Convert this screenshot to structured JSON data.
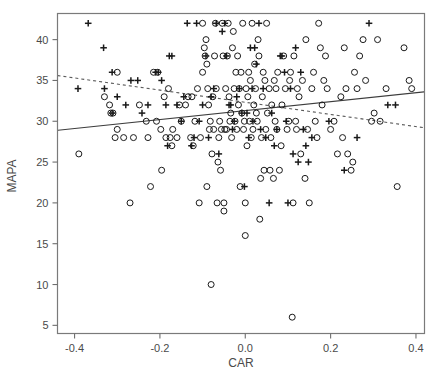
{
  "figure": {
    "background_color": "#ffffff",
    "frame_color": "#7a7a7a",
    "axis_color": "#6e6e6e",
    "label_color": "#4a4a4a",
    "marker_color": "#1a1a1a"
  },
  "chart_data": {
    "type": "scatter",
    "title": "",
    "xlabel": "CAR",
    "ylabel": "MAPA",
    "xlim": [
      -0.44,
      0.42
    ],
    "ylim": [
      4.0,
      43.2
    ],
    "xticks": [
      -0.4,
      -0.2,
      0.0,
      0.2,
      0.4
    ],
    "xticklabels": [
      "-0.4",
      "-0.2",
      "0.0",
      "0.2",
      "0.4"
    ],
    "yticks": [
      5,
      10,
      15,
      20,
      25,
      30,
      35,
      40
    ],
    "yticklabels": [
      "5",
      "10",
      "15",
      "20",
      "25",
      "30",
      "35",
      "40"
    ],
    "grid": false,
    "legend": null,
    "frame": "box",
    "series": [
      {
        "name": "circle-group",
        "marker": "circle",
        "points": [
          [
            -0.39,
            26
          ],
          [
            -0.33,
            33
          ],
          [
            -0.318,
            32
          ],
          [
            -0.315,
            31
          ],
          [
            -0.31,
            31
          ],
          [
            -0.3,
            29
          ],
          [
            -0.3,
            36
          ],
          [
            -0.305,
            28
          ],
          [
            -0.285,
            28
          ],
          [
            -0.27,
            20
          ],
          [
            -0.262,
            28
          ],
          [
            -0.248,
            32
          ],
          [
            -0.232,
            30
          ],
          [
            -0.228,
            28
          ],
          [
            -0.222,
            22
          ],
          [
            -0.215,
            36
          ],
          [
            -0.208,
            30
          ],
          [
            -0.205,
            36
          ],
          [
            -0.198,
            29
          ],
          [
            -0.196,
            24
          ],
          [
            -0.19,
            33
          ],
          [
            -0.186,
            28
          ],
          [
            -0.18,
            34
          ],
          [
            -0.176,
            28
          ],
          [
            -0.172,
            27
          ],
          [
            -0.17,
            29
          ],
          [
            -0.16,
            28
          ],
          [
            -0.154,
            32
          ],
          [
            -0.15,
            30
          ],
          [
            -0.14,
            32
          ],
          [
            -0.134,
            33
          ],
          [
            -0.128,
            28
          ],
          [
            -0.125,
            33
          ],
          [
            -0.122,
            27
          ],
          [
            -0.118,
            30
          ],
          [
            -0.112,
            34
          ],
          [
            -0.108,
            20
          ],
          [
            -0.105,
            28
          ],
          [
            -0.1,
            36
          ],
          [
            -0.1,
            42
          ],
          [
            -0.096,
            39
          ],
          [
            -0.094,
            38
          ],
          [
            -0.092,
            40
          ],
          [
            -0.09,
            37
          ],
          [
            -0.09,
            22
          ],
          [
            -0.088,
            34
          ],
          [
            -0.086,
            32
          ],
          [
            -0.084,
            29
          ],
          [
            -0.082,
            30
          ],
          [
            -0.08,
            10
          ],
          [
            -0.078,
            26
          ],
          [
            -0.076,
            33
          ],
          [
            -0.074,
            29
          ],
          [
            -0.072,
            38
          ],
          [
            -0.07,
            42
          ],
          [
            -0.068,
            34
          ],
          [
            -0.066,
            20
          ],
          [
            -0.064,
            25
          ],
          [
            -0.062,
            28
          ],
          [
            -0.06,
            30
          ],
          [
            -0.058,
            24
          ],
          [
            -0.056,
            29
          ],
          [
            -0.054,
            42
          ],
          [
            -0.052,
            38
          ],
          [
            -0.05,
            19
          ],
          [
            -0.05,
            20
          ],
          [
            -0.048,
            29
          ],
          [
            -0.046,
            34
          ],
          [
            -0.044,
            29
          ],
          [
            -0.042,
            38
          ],
          [
            -0.04,
            42
          ],
          [
            -0.038,
            33
          ],
          [
            -0.036,
            30
          ],
          [
            -0.034,
            31
          ],
          [
            -0.032,
            28
          ],
          [
            -0.03,
            39
          ],
          [
            -0.028,
            41
          ],
          [
            -0.026,
            34
          ],
          [
            -0.024,
            30
          ],
          [
            -0.022,
            36
          ],
          [
            -0.02,
            29
          ],
          [
            -0.018,
            38
          ],
          [
            -0.016,
            32
          ],
          [
            -0.014,
            34
          ],
          [
            -0.012,
            22
          ],
          [
            -0.01,
            36
          ],
          [
            -0.008,
            31
          ],
          [
            -0.006,
            42
          ],
          [
            -0.004,
            29
          ],
          [
            -0.002,
            30
          ],
          [
            0.0,
            16
          ],
          [
            0.0,
            20
          ],
          [
            0.002,
            34
          ],
          [
            0.004,
            27
          ],
          [
            0.006,
            33
          ],
          [
            0.008,
            36
          ],
          [
            0.01,
            30
          ],
          [
            0.012,
            35
          ],
          [
            0.014,
            28
          ],
          [
            0.016,
            42
          ],
          [
            0.018,
            29
          ],
          [
            0.02,
            32
          ],
          [
            0.022,
            37
          ],
          [
            0.024,
            34
          ],
          [
            0.026,
            31
          ],
          [
            0.028,
            30
          ],
          [
            0.03,
            40
          ],
          [
            0.032,
            38
          ],
          [
            0.034,
            18
          ],
          [
            0.036,
            23
          ],
          [
            0.038,
            28
          ],
          [
            0.04,
            33
          ],
          [
            0.042,
            36
          ],
          [
            0.044,
            24
          ],
          [
            0.046,
            35
          ],
          [
            0.048,
            29
          ],
          [
            0.05,
            42
          ],
          [
            0.052,
            31
          ],
          [
            0.056,
            34
          ],
          [
            0.058,
            24
          ],
          [
            0.06,
            28
          ],
          [
            0.062,
            32
          ],
          [
            0.066,
            23
          ],
          [
            0.068,
            35
          ],
          [
            0.07,
            30
          ],
          [
            0.072,
            34
          ],
          [
            0.074,
            29
          ],
          [
            0.076,
            36
          ],
          [
            0.08,
            24
          ],
          [
            0.084,
            27
          ],
          [
            0.086,
            32
          ],
          [
            0.09,
            38
          ],
          [
            0.094,
            34
          ],
          [
            0.098,
            29
          ],
          [
            0.102,
            30
          ],
          [
            0.104,
            35
          ],
          [
            0.106,
            36
          ],
          [
            0.11,
            6
          ],
          [
            0.112,
            20
          ],
          [
            0.114,
            38
          ],
          [
            0.118,
            30
          ],
          [
            0.12,
            29
          ],
          [
            0.122,
            34
          ],
          [
            0.126,
            33
          ],
          [
            0.13,
            26
          ],
          [
            0.134,
            35
          ],
          [
            0.14,
            23
          ],
          [
            0.142,
            40
          ],
          [
            0.146,
            29
          ],
          [
            0.15,
            20
          ],
          [
            0.156,
            34
          ],
          [
            0.16,
            36
          ],
          [
            0.164,
            30
          ],
          [
            0.168,
            28
          ],
          [
            0.172,
            42
          ],
          [
            0.176,
            39
          ],
          [
            0.18,
            32
          ],
          [
            0.184,
            35
          ],
          [
            0.188,
            38
          ],
          [
            0.192,
            34
          ],
          [
            0.2,
            29
          ],
          [
            0.208,
            30
          ],
          [
            0.216,
            26
          ],
          [
            0.224,
            33
          ],
          [
            0.228,
            28
          ],
          [
            0.232,
            39
          ],
          [
            0.236,
            34
          ],
          [
            0.24,
            26
          ],
          [
            0.248,
            24
          ],
          [
            0.252,
            25
          ],
          [
            0.256,
            36
          ],
          [
            0.262,
            34
          ],
          [
            0.268,
            38
          ],
          [
            0.276,
            40
          ],
          [
            0.282,
            35
          ],
          [
            0.296,
            30
          ],
          [
            0.302,
            31
          ],
          [
            0.31,
            40
          ],
          [
            0.316,
            30
          ],
          [
            0.33,
            34
          ],
          [
            0.356,
            22
          ],
          [
            0.372,
            39
          ],
          [
            0.384,
            35
          ],
          [
            0.39,
            34
          ]
        ]
      },
      {
        "name": "plus-group",
        "marker": "plus",
        "points": [
          [
            -0.368,
            42
          ],
          [
            -0.392,
            34
          ],
          [
            -0.332,
            39
          ],
          [
            -0.33,
            34
          ],
          [
            -0.312,
            36
          ],
          [
            -0.312,
            31
          ],
          [
            -0.3,
            33
          ],
          [
            -0.28,
            32
          ],
          [
            -0.268,
            35
          ],
          [
            -0.252,
            35
          ],
          [
            -0.242,
            31
          ],
          [
            -0.228,
            32
          ],
          [
            -0.21,
            36
          ],
          [
            -0.204,
            36
          ],
          [
            -0.196,
            35
          ],
          [
            -0.186,
            32
          ],
          [
            -0.182,
            27
          ],
          [
            -0.178,
            38
          ],
          [
            -0.172,
            38
          ],
          [
            -0.16,
            32
          ],
          [
            -0.15,
            30
          ],
          [
            -0.144,
            33
          ],
          [
            -0.136,
            42
          ],
          [
            -0.126,
            27
          ],
          [
            -0.12,
            28
          ],
          [
            -0.114,
            42
          ],
          [
            -0.108,
            30
          ],
          [
            -0.1,
            32
          ],
          [
            -0.092,
            38
          ],
          [
            -0.086,
            28
          ],
          [
            -0.08,
            33
          ],
          [
            -0.074,
            34
          ],
          [
            -0.068,
            42
          ],
          [
            -0.062,
            26
          ],
          [
            -0.054,
            41
          ],
          [
            -0.048,
            42
          ],
          [
            -0.044,
            38
          ],
          [
            -0.038,
            32
          ],
          [
            -0.034,
            32
          ],
          [
            -0.03,
            29
          ],
          [
            -0.026,
            30
          ],
          [
            -0.02,
            33
          ],
          [
            -0.014,
            34
          ],
          [
            -0.008,
            31
          ],
          [
            -0.002,
            22
          ],
          [
            0.004,
            31
          ],
          [
            0.008,
            28
          ],
          [
            0.012,
            39
          ],
          [
            0.016,
            34
          ],
          [
            0.018,
            30
          ],
          [
            0.022,
            39
          ],
          [
            0.026,
            37
          ],
          [
            0.032,
            42
          ],
          [
            0.036,
            29
          ],
          [
            0.042,
            34
          ],
          [
            0.048,
            28
          ],
          [
            0.056,
            20
          ],
          [
            0.062,
            31
          ],
          [
            0.068,
            27
          ],
          [
            0.074,
            29
          ],
          [
            0.082,
            38
          ],
          [
            0.086,
            38
          ],
          [
            0.092,
            36
          ],
          [
            0.096,
            30
          ],
          [
            0.1,
            20
          ],
          [
            0.106,
            34
          ],
          [
            0.112,
            26
          ],
          [
            0.118,
            39
          ],
          [
            0.124,
            25
          ],
          [
            0.13,
            36
          ],
          [
            0.136,
            29
          ],
          [
            0.142,
            27
          ],
          [
            0.148,
            25
          ],
          [
            0.156,
            28
          ],
          [
            0.232,
            24
          ],
          [
            0.262,
            28
          ],
          [
            0.29,
            42
          ],
          [
            0.334,
            32
          ],
          [
            0.352,
            32
          ],
          [
            0.196,
            30
          ]
        ]
      }
    ],
    "fit_lines": [
      {
        "name": "solid-regression-line",
        "style": "solid",
        "x0": -0.44,
        "y0": 28.9,
        "x1": 0.42,
        "y1": 33.6,
        "color": "#3d3d3d"
      },
      {
        "name": "dashed-regression-line",
        "style": "dashed",
        "x0": -0.44,
        "y0": 35.6,
        "x1": 0.42,
        "y1": 29.2,
        "color": "#5a5a5a"
      }
    ]
  }
}
